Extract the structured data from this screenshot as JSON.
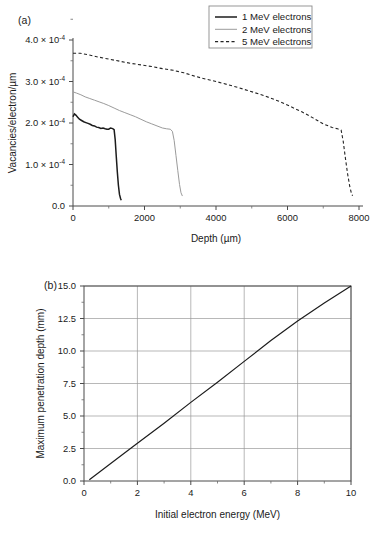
{
  "figure": {
    "panel_a_label": "(a)",
    "panel_b_label": "(b)"
  },
  "chart_data": [
    {
      "panel": "(a)",
      "type": "line",
      "title": "",
      "xlabel": "Depth (µm)",
      "ylabel": "Vacancies/electron/µm",
      "xlim": [
        0,
        8000
      ],
      "ylim": [
        0,
        0.0004
      ],
      "xticks": [
        0,
        2000,
        4000,
        6000,
        8000
      ],
      "xticklabels": [
        "0",
        "2000",
        "4000",
        "6000",
        "8000"
      ],
      "yticks": [
        0,
        0.0001,
        0.0002,
        0.0003,
        0.0004
      ],
      "yticklabels": [
        "0.0",
        "1.0 × 10",
        "2.0 × 10",
        "3.0 × 10",
        "4.0 × 10"
      ],
      "y_exponent": "-4",
      "grid": false,
      "minor_ticks": true,
      "legend_position": "top-right",
      "series": [
        {
          "name": "1 MeV electrons",
          "style": "solid",
          "color": "#1c1c1c",
          "linewidth": 1.5,
          "x": [
            0,
            40,
            80,
            130,
            180,
            240,
            300,
            360,
            420,
            480,
            540,
            600,
            660,
            720,
            780,
            840,
            900,
            950,
            1000,
            1050,
            1090,
            1120,
            1150,
            1180,
            1210,
            1240,
            1270,
            1300,
            1330,
            1350
          ],
          "y": [
            0.000215,
            0.000222,
            0.000219,
            0.000214,
            0.000209,
            0.000206,
            0.000203,
            0.000201,
            0.000199,
            0.000197,
            0.000194,
            0.000193,
            0.00019,
            0.000189,
            0.000187,
            0.000188,
            0.000186,
            0.000185,
            0.000185,
            0.000188,
            0.000187,
            0.000186,
            0.000184,
            0.00016,
            0.00012,
            8.2e-05,
            5e-05,
            2.8e-05,
            1.8e-05,
            1.4e-05
          ]
        },
        {
          "name": "2 MeV electrons",
          "style": "solid",
          "color": "#9b9b9b",
          "linewidth": 1.0,
          "x": [
            0,
            100,
            220,
            340,
            470,
            600,
            730,
            860,
            1000,
            1150,
            1300,
            1450,
            1600,
            1750,
            1900,
            2050,
            2200,
            2350,
            2500,
            2620,
            2720,
            2780,
            2830,
            2880,
            2930,
            2980,
            3020,
            3060
          ],
          "y": [
            0.000275,
            0.000272,
            0.000268,
            0.000263,
            0.000259,
            0.000255,
            0.000251,
            0.000247,
            0.000242,
            0.000236,
            0.00023,
            0.000225,
            0.00022,
            0.000215,
            0.000209,
            0.000203,
            0.000198,
            0.000193,
            0.000188,
            0.000186,
            0.000185,
            0.00018,
            0.000158,
            0.000122,
            8.6e-05,
            5.2e-05,
            3.2e-05,
            2.4e-05
          ]
        },
        {
          "name": "5 MeV electrons",
          "style": "dashed",
          "color": "#232323",
          "linewidth": 1.1,
          "x": [
            0,
            200,
            450,
            700,
            1000,
            1300,
            1600,
            1900,
            2200,
            2500,
            2800,
            3100,
            3400,
            3700,
            4000,
            4300,
            4600,
            4900,
            5200,
            5500,
            5800,
            6100,
            6400,
            6700,
            7000,
            7250,
            7400,
            7500,
            7560,
            7620,
            7680,
            7740,
            7790,
            7820
          ],
          "y": [
            0.000368,
            0.000368,
            0.000364,
            0.000359,
            0.000354,
            0.000349,
            0.000344,
            0.00034,
            0.000336,
            0.000331,
            0.000327,
            0.000321,
            0.000313,
            0.000306,
            0.0003,
            0.000293,
            0.000286,
            0.000278,
            0.00027,
            0.000261,
            0.000251,
            0.000239,
            0.000227,
            0.000213,
            0.000198,
            0.000189,
            0.000186,
            0.000183,
            0.000155,
            0.000115,
            7.8e-05,
            4.8e-05,
            3e-05,
            2.5e-05
          ]
        }
      ]
    },
    {
      "panel": "(b)",
      "type": "line",
      "title": "",
      "xlabel": "Initial electron energy (MeV)",
      "ylabel": "Maximum penetration depth (mm)",
      "xlim": [
        0,
        10
      ],
      "ylim": [
        0,
        15
      ],
      "xticks": [
        0,
        2,
        4,
        6,
        8,
        10
      ],
      "xticklabels": [
        "0",
        "2",
        "4",
        "6",
        "8",
        "10"
      ],
      "yticks": [
        0,
        2.5,
        5.0,
        7.5,
        10.0,
        12.5,
        15.0
      ],
      "yticklabels": [
        "0.0",
        "2.5",
        "5.0",
        "7.5",
        "10.0",
        "12.5",
        "15.0"
      ],
      "grid": true,
      "minor_ticks": true,
      "legend_position": "none",
      "series": [
        {
          "name": "Maximum penetration depth",
          "style": "solid",
          "color": "#1c1c1c",
          "linewidth": 1.2,
          "x": [
            0.2,
            1,
            2,
            3,
            4,
            5,
            6,
            7,
            8,
            9,
            10
          ],
          "y": [
            0.1,
            1.35,
            2.9,
            4.45,
            6.05,
            7.6,
            9.2,
            10.8,
            12.3,
            13.7,
            15.0
          ]
        }
      ]
    }
  ],
  "panel_a": {
    "label": "(a)",
    "x_axis_title": "Depth (µm)",
    "y_axis_title": "Vacancies/electron/µm",
    "x_tick_labels": [
      "0",
      "2000",
      "4000",
      "6000",
      "8000"
    ],
    "y_tick_labels": [
      {
        "mantissa": "0.0",
        "has_exp": false
      },
      {
        "mantissa": "1.0 × 10",
        "has_exp": true,
        "exp": "-4"
      },
      {
        "mantissa": "2.0 × 10",
        "has_exp": true,
        "exp": "-4"
      },
      {
        "mantissa": "3.0 × 10",
        "has_exp": true,
        "exp": "-4"
      },
      {
        "mantissa": "4.0 × 10",
        "has_exp": true,
        "exp": "-4"
      }
    ],
    "legend": {
      "items": [
        {
          "label": "1 MeV electrons",
          "style": "solid-dark"
        },
        {
          "label": "2 MeV electrons",
          "style": "solid-gray"
        },
        {
          "label": "5 MeV electrons",
          "style": "dashed-dark"
        }
      ]
    }
  },
  "panel_b": {
    "label": "(b)",
    "x_axis_title": "Initial electron energy (MeV)",
    "y_axis_title": "Maximum penetration depth (mm)",
    "x_tick_labels": [
      "0",
      "2",
      "4",
      "6",
      "8",
      "10"
    ],
    "y_tick_labels": [
      "0.0",
      "2.5",
      "5.0",
      "7.5",
      "10.0",
      "12.5",
      "15.0"
    ]
  },
  "colors": {
    "series_1": "#1c1c1c",
    "series_2": "#9b9b9b",
    "series_3": "#232323",
    "axis": "#4a4a4a",
    "grid": "#9a9a9a",
    "legend_border": "#8c8c8c"
  }
}
